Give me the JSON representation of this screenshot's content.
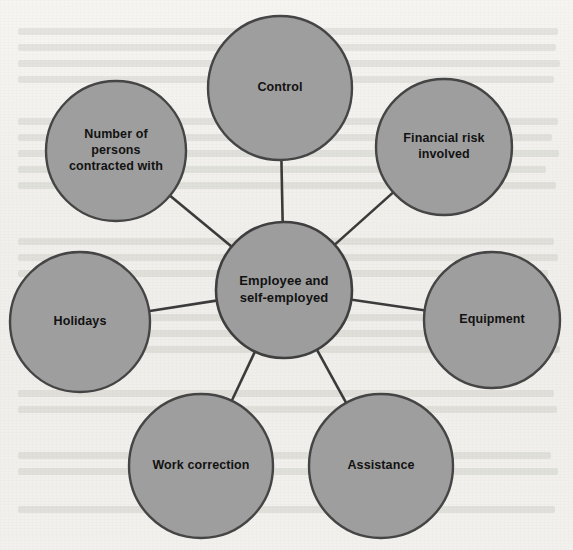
{
  "page": {
    "background_color": "#f3f2ef",
    "width": 573,
    "height": 550
  },
  "diagram": {
    "type": "hub-and-spoke",
    "node_fill_color": "#9e9e9e",
    "node_border_color": "#454545",
    "connector_color": "#3b3b3b",
    "label_color": "#121212",
    "hub": {
      "id": "employee-and-self-employed",
      "label": "Employee and self-employed",
      "lines": [
        "Employee and",
        "self-employed"
      ],
      "cx": 284,
      "cy": 290,
      "r": 68
    },
    "satellites": [
      {
        "id": "control",
        "label": "Control",
        "lines": [
          "Control"
        ],
        "cx": 280,
        "cy": 88,
        "r": 72
      },
      {
        "id": "financial-risk-involved",
        "label": "Financial risk involved",
        "lines": [
          "Financial risk",
          "involved"
        ],
        "cx": 444,
        "cy": 147,
        "r": 68
      },
      {
        "id": "equipment",
        "label": "Equipment",
        "lines": [
          "Equipment"
        ],
        "cx": 492,
        "cy": 320,
        "r": 68
      },
      {
        "id": "assistance",
        "label": "Assistance",
        "lines": [
          "Assistance"
        ],
        "cx": 381,
        "cy": 466,
        "r": 72
      },
      {
        "id": "work-correction",
        "label": "Work correction",
        "lines": [
          "Work correction"
        ],
        "cx": 201,
        "cy": 466,
        "r": 72
      },
      {
        "id": "holidays",
        "label": "Holidays",
        "lines": [
          "Holidays"
        ],
        "cx": 80,
        "cy": 322,
        "r": 70
      },
      {
        "id": "number-of-persons-contracted-with",
        "label": "Number of persons contracted with",
        "lines": [
          "Number of",
          "persons",
          "contracted with"
        ],
        "cx": 116,
        "cy": 151,
        "r": 70
      }
    ]
  }
}
